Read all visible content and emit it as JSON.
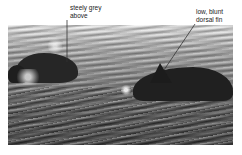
{
  "photo": {
    "subject": "two porpoises surfacing in rippled water",
    "tone": "grayscale"
  },
  "annotations": [
    {
      "text": "steely grey\nabove",
      "target": "back of left porpoise"
    },
    {
      "text": "low, blunt\ndorsal fin",
      "target": "dorsal fin of right porpoise"
    }
  ],
  "colors": {
    "background": "#ffffff",
    "label_text": "#222222",
    "leader_line": "#333333"
  }
}
